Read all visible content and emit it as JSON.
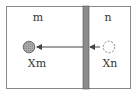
{
  "diagram": {
    "compartments": [
      {
        "id": "m",
        "label": "m",
        "species_label": "Xm",
        "particle": "filled"
      },
      {
        "id": "n",
        "label": "n",
        "species_label": "Xn",
        "particle": "dashed"
      }
    ],
    "membrane": {
      "description": "barrier between compartments"
    },
    "arrow": {
      "direction": "n-to-m"
    },
    "colors": {
      "border": "#888888",
      "membrane_fill": "#8c8c8c",
      "membrane_edge": "#555555",
      "particle_fill": "#a0a0a0",
      "particle_stroke": "#555555",
      "dashed_stroke": "#666666",
      "arrow": "#444444",
      "text": "#333333"
    }
  }
}
